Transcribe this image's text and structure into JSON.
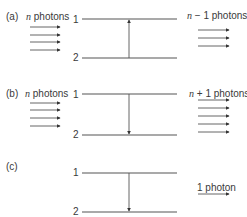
{
  "colors": {
    "line": "#555555",
    "text": "#3a3a3a",
    "background": "#ffffff"
  },
  "panels": [
    {
      "id": "a",
      "label": "(a)",
      "incoming_label_var": "n",
      "incoming_label_rest": " photons",
      "incoming_count": 4,
      "outgoing_label_var": "n",
      "outgoing_label_rest": " − 1 photons",
      "outgoing_count": 3,
      "level_upper": "1",
      "level_lower": "2",
      "transition": "up",
      "y_upper": 19,
      "y_lower": 58,
      "y_label": 12,
      "in_arrow_y": [
        27,
        35,
        42,
        50
      ],
      "out_arrow_y": [
        30,
        38,
        46
      ]
    },
    {
      "id": "b",
      "label": "(b)",
      "incoming_label_var": "n",
      "incoming_label_rest": " photons",
      "incoming_count": 4,
      "outgoing_label_var": "n",
      "outgoing_label_rest": " + 1 photons",
      "outgoing_count": 5,
      "level_upper": "1",
      "level_lower": "2",
      "transition": "down",
      "y_upper": 94,
      "y_lower": 135,
      "y_label": 87,
      "in_arrow_y": [
        103,
        110,
        118,
        126
      ],
      "out_arrow_y": [
        100,
        108,
        116,
        124,
        132
      ]
    },
    {
      "id": "c",
      "label": "(c)",
      "incoming_label_var": "",
      "incoming_label_rest": "",
      "incoming_count": 0,
      "outgoing_label_var": "",
      "outgoing_label_rest": "1 photon",
      "outgoing_count": 1,
      "level_upper": "1",
      "level_lower": "2",
      "transition": "down",
      "y_upper": 173,
      "y_lower": 212,
      "y_label": 167,
      "in_arrow_y": [],
      "out_arrow_y": [
        194
      ],
      "out_label_y": 183
    }
  ]
}
